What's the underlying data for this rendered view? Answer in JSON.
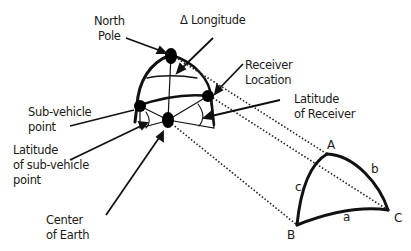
{
  "diagram": {
    "labels": {
      "north_pole": [
        "North",
        "Pole"
      ],
      "delta_longitude": "Δ Longitude",
      "receiver_location": [
        "Receiver",
        "Location"
      ],
      "latitude_of_receiver": [
        "Latitude",
        "of Receiver"
      ],
      "sub_vehicle_point": [
        "Sub-vehicle",
        "point"
      ],
      "latitude_of_sub_vehicle_point": [
        "Latitude",
        "of sub-vehicle",
        "point"
      ],
      "center_of_earth": [
        "Center",
        "of Earth"
      ]
    },
    "triangle": {
      "vertices": {
        "A": "A",
        "B": "B",
        "C": "C"
      },
      "sides": {
        "a": "a",
        "b": "b",
        "c": "c"
      }
    },
    "colors": {
      "line": "#111111",
      "background": "#ffffff"
    }
  }
}
